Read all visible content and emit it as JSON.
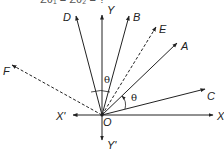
{
  "header": {
    "cutoff_text": "Σθ₁ = Σθ₂ = ?"
  },
  "diagram": {
    "origin": {
      "label": "O",
      "x": 102,
      "y": 115
    },
    "stroke_color": "#222222",
    "rays": [
      {
        "name": "Y",
        "label": "Y",
        "tip": [
          102,
          15
        ],
        "dashed": false,
        "label_pos": [
          107,
          14
        ]
      },
      {
        "name": "D",
        "label": "D",
        "tip": [
          76,
          16
        ],
        "dashed": false,
        "label_pos": [
          63,
          21
        ]
      },
      {
        "name": "B",
        "label": "B",
        "tip": [
          129,
          16
        ],
        "dashed": false,
        "label_pos": [
          133,
          21
        ]
      },
      {
        "name": "E",
        "label": "E",
        "tip": [
          156,
          27
        ],
        "dashed": true,
        "label_pos": [
          159,
          33
        ]
      },
      {
        "name": "A",
        "label": "A",
        "tip": [
          177,
          43
        ],
        "dashed": false,
        "label_pos": [
          181,
          50
        ]
      },
      {
        "name": "C",
        "label": "C",
        "tip": [
          205,
          89
        ],
        "dashed": false,
        "label_pos": [
          207,
          100
        ]
      },
      {
        "name": "X",
        "label": "X",
        "tip": [
          213,
          115
        ],
        "dashed": false,
        "label_pos": [
          217,
          120
        ]
      },
      {
        "name": "X'",
        "label": "X'",
        "tip": [
          73,
          115
        ],
        "dashed": false,
        "label_pos": [
          56,
          120
        ]
      },
      {
        "name": "F",
        "label": "F",
        "tip": [
          12,
          65
        ],
        "dashed": true,
        "label_pos": [
          3,
          75
        ]
      },
      {
        "name": "Y'",
        "label": "Y'",
        "tip": [
          102,
          140
        ],
        "dashed": false,
        "label_pos": [
          107,
          149
        ]
      }
    ],
    "angles": [
      {
        "label": "θ",
        "between": [
          "D",
          "B"
        ],
        "label_pos": [
          104,
          83
        ]
      },
      {
        "label": "θ",
        "between": [
          "C",
          "A"
        ],
        "label_pos": [
          131,
          101
        ]
      }
    ]
  }
}
